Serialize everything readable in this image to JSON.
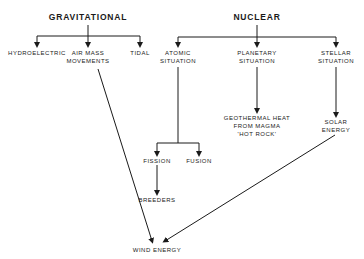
{
  "diagram": {
    "roots": {
      "gravitational": "GRAVITATIONAL",
      "nuclear": "NUCLEAR"
    },
    "gravitational_children": {
      "hydroelectric": "HYDROELECTRIC",
      "air_mass_1": "AIR  MASS",
      "air_mass_2": "MOVEMENTS",
      "tidal": "TIDAL"
    },
    "nuclear_children": {
      "atomic_1": "ATOMIC",
      "atomic_2": "SITUATION",
      "planetary_1": "PLANETARY",
      "planetary_2": "SITUATION",
      "stellar_1": "STELLAR",
      "stellar_2": "SITUATION"
    },
    "atomic_children": {
      "fission": "FISSION",
      "fusion": "FUSION",
      "breeders": "BREEDERS"
    },
    "planetary_children": {
      "geo_1": "GEOTHERMAL  HEAT",
      "geo_2": "FROM  MAGMA",
      "geo_3": "'HOT  ROCK'"
    },
    "stellar_children": {
      "solar_1": "SOLAR",
      "solar_2": "ENERGY"
    },
    "sink": {
      "wind": "WIND ENERGY"
    },
    "line_color": "#1a1a1a"
  }
}
